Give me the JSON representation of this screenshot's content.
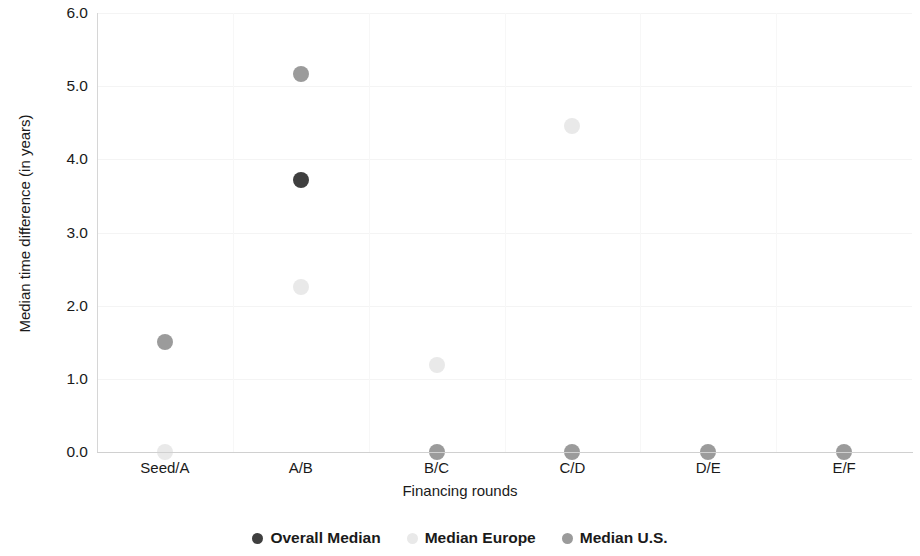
{
  "chart_data": {
    "type": "scatter",
    "title": "",
    "xlabel": "Financing rounds",
    "ylabel": "Median time difference (in years)",
    "categories": [
      "Seed/A",
      "A/B",
      "B/C",
      "C/D",
      "D/E",
      "E/F"
    ],
    "ylim": [
      0.0,
      6.0
    ],
    "ytick_labels": [
      "0.0",
      "1.0",
      "2.0",
      "3.0",
      "4.0",
      "5.0",
      "6.0"
    ],
    "ytick_values": [
      0.0,
      1.0,
      2.0,
      3.0,
      4.0,
      5.0,
      6.0
    ],
    "grid": true,
    "legend_position": "bottom",
    "series": [
      {
        "name": "Overall Median",
        "color": "#3f3f3f",
        "points": [
          {
            "x": "A/B",
            "y": 3.72
          }
        ]
      },
      {
        "name": "Median Europe",
        "color": "#e9e9e9",
        "points": [
          {
            "x": "Seed/A",
            "y": 0.0
          },
          {
            "x": "A/B",
            "y": 2.25
          },
          {
            "x": "B/C",
            "y": 1.19
          },
          {
            "x": "C/D",
            "y": 4.45
          }
        ]
      },
      {
        "name": "Median U.S.",
        "color": "#9b9b9b",
        "points": [
          {
            "x": "Seed/A",
            "y": 1.51
          },
          {
            "x": "A/B",
            "y": 5.16
          },
          {
            "x": "B/C",
            "y": 0.0
          },
          {
            "x": "C/D",
            "y": 0.0
          },
          {
            "x": "D/E",
            "y": 0.0
          },
          {
            "x": "E/F",
            "y": 0.0
          }
        ]
      }
    ]
  },
  "legend": {
    "items": [
      {
        "label": "Overall Median",
        "color": "#3f3f3f"
      },
      {
        "label": "Median Europe",
        "color": "#e9e9e9"
      },
      {
        "label": "Median U.S.",
        "color": "#9b9b9b"
      }
    ]
  }
}
